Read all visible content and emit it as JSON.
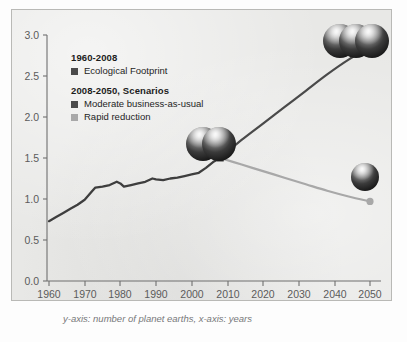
{
  "figure": {
    "caption": "y-axis: number of planet earths, x-axis: years",
    "panel_color": "#e8e8e6",
    "border_color": "#b9b9b6"
  },
  "legend": {
    "groups": [
      {
        "title": "1960-2008",
        "entries": [
          {
            "label": "Ecological Footprint",
            "color": "#4a4a4a"
          }
        ]
      },
      {
        "title": "2008-2050, Scenarios",
        "entries": [
          {
            "label": "Moderate business-as-usual",
            "color": "#4a4a4a"
          },
          {
            "label": "Rapid reduction",
            "color": "#a8a8a8"
          }
        ]
      }
    ]
  },
  "icons": [
    {
      "name": "three-earths-icon",
      "count": 3,
      "position": "top-right",
      "meaning": "about three planet earths"
    },
    {
      "name": "two-earths-icon",
      "count": 2,
      "position": "mid-chart",
      "meaning": "about one and a half planet earths"
    },
    {
      "name": "one-earth-icon",
      "count": 1,
      "position": "lower-right",
      "meaning": "about one planet earth"
    }
  ],
  "chart_data": {
    "type": "line",
    "title": "",
    "xlabel": "years",
    "ylabel": "number of planet earths",
    "xlim": [
      1960,
      2053
    ],
    "ylim": [
      0.0,
      3.15
    ],
    "xticks": [
      1960,
      1970,
      1980,
      1990,
      2000,
      2010,
      2020,
      2030,
      2040,
      2050
    ],
    "yticks": [
      "0.0",
      "0.5",
      "1.0",
      "1.5",
      "2.0",
      "2.5",
      "3.0"
    ],
    "ytick_values": [
      0.0,
      0.5,
      1.0,
      1.5,
      2.0,
      2.5,
      3.0
    ],
    "grid": false,
    "legend_position": "upper-left-inside",
    "series": [
      {
        "name": "Ecological Footprint",
        "period": "1960-2008",
        "color": "#4a4a4a",
        "x": [
          1960,
          1962,
          1964,
          1966,
          1968,
          1970,
          1972,
          1973,
          1975,
          1977,
          1979,
          1980,
          1981,
          1983,
          1985,
          1987,
          1989,
          1990,
          1992,
          1994,
          1996,
          1998,
          2000,
          2002,
          2004,
          2006,
          2008
        ],
        "y": [
          0.73,
          0.78,
          0.83,
          0.88,
          0.93,
          0.99,
          1.09,
          1.14,
          1.15,
          1.17,
          1.21,
          1.19,
          1.15,
          1.17,
          1.19,
          1.21,
          1.25,
          1.24,
          1.23,
          1.25,
          1.26,
          1.28,
          1.3,
          1.32,
          1.38,
          1.45,
          1.5
        ]
      },
      {
        "name": "Moderate business-as-usual",
        "period": "2008-2050",
        "color": "#4a4a4a",
        "x": [
          2008,
          2014,
          2020,
          2026,
          2032,
          2038,
          2044,
          2050
        ],
        "y": [
          1.5,
          1.72,
          1.92,
          2.12,
          2.32,
          2.52,
          2.7,
          2.85
        ],
        "endpoint_marker": "circle"
      },
      {
        "name": "Rapid reduction",
        "period": "2008-2050",
        "color": "#a8a8a8",
        "x": [
          2008,
          2014,
          2020,
          2026,
          2032,
          2038,
          2044,
          2050
        ],
        "y": [
          1.5,
          1.42,
          1.34,
          1.26,
          1.18,
          1.1,
          1.03,
          0.97
        ],
        "endpoint_marker": "circle"
      }
    ],
    "annotations": [
      {
        "text": "branch point",
        "x": 2008,
        "y": 1.5,
        "marker": "square"
      }
    ]
  }
}
